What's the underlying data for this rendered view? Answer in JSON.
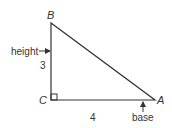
{
  "diagram": {
    "type": "right-triangle",
    "vertices": {
      "A": {
        "label": "A",
        "x": 155,
        "y": 100
      },
      "B": {
        "label": "B",
        "x": 51,
        "y": 23
      },
      "C": {
        "label": "C",
        "x": 51,
        "y": 100
      }
    },
    "right_angle_at": "C",
    "sides": {
      "BC": {
        "length_label": "3",
        "role": "height"
      },
      "CA": {
        "length_label": "4",
        "role": "base"
      }
    },
    "annotations": {
      "height_label": "height",
      "base_label": "base"
    },
    "colors": {
      "stroke": "#333333",
      "text": "#333333",
      "background": "#ffffff"
    }
  }
}
